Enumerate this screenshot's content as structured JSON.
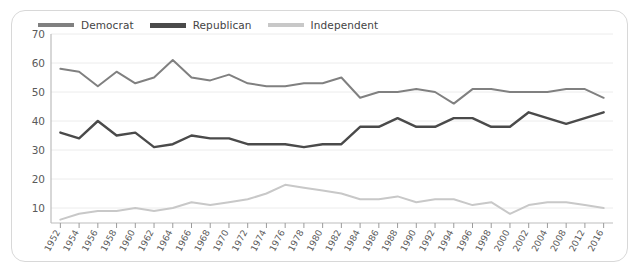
{
  "chart_data": {
    "type": "line",
    "title": "",
    "subtitle": "",
    "xlabel": "",
    "ylabel": "",
    "ylim": [
      0,
      70
    ],
    "yticks": [
      10,
      20,
      30,
      40,
      50,
      60,
      70
    ],
    "grid": true,
    "legend_position": "top-left",
    "legend": [
      "Democrat",
      "Republican",
      "Independent"
    ],
    "categories": [
      "1952",
      "1954",
      "1956",
      "1958",
      "1960",
      "1962",
      "1964",
      "1966",
      "1968",
      "1970",
      "1972",
      "1974",
      "1976",
      "1978",
      "1980",
      "1982",
      "1984",
      "1986",
      "1988",
      "1990",
      "1992",
      "1994",
      "1996",
      "1998",
      "2000",
      "2002",
      "2004",
      "2008",
      "2012",
      "2016"
    ],
    "series": [
      {
        "name": "Democrat",
        "color": "#808080",
        "values": [
          58,
          57,
          52,
          57,
          53,
          55,
          61,
          55,
          54,
          56,
          53,
          52,
          52,
          53,
          53,
          55,
          48,
          50,
          50,
          51,
          50,
          46,
          51,
          51,
          50,
          50,
          50,
          51,
          51,
          48
        ]
      },
      {
        "name": "Republican",
        "color": "#4a4a4a",
        "values": [
          36,
          34,
          40,
          35,
          36,
          31,
          32,
          35,
          34,
          34,
          32,
          32,
          32,
          31,
          32,
          32,
          38,
          38,
          41,
          38,
          38,
          41,
          41,
          38,
          38,
          43,
          41,
          39,
          41,
          43
        ]
      },
      {
        "name": "Independent",
        "color": "#c8c8c8",
        "values": [
          6,
          8,
          9,
          9,
          10,
          9,
          10,
          12,
          11,
          12,
          13,
          15,
          18,
          17,
          16,
          15,
          13,
          13,
          14,
          12,
          13,
          13,
          11,
          12,
          8,
          11,
          12,
          12,
          11,
          10
        ]
      }
    ]
  },
  "axes": {
    "y_tick_labels": [
      "70",
      "60",
      "50",
      "40",
      "30",
      "20",
      "10"
    ],
    "x_tick_labels": [
      "1952",
      "1954",
      "1956",
      "1958",
      "1960",
      "1962",
      "1964",
      "1966",
      "1968",
      "1970",
      "1972",
      "1974",
      "1976",
      "1978",
      "1980",
      "1982",
      "1984",
      "1986",
      "1988",
      "1990",
      "1992",
      "1994",
      "1996",
      "1998",
      "2000",
      "2002",
      "2004",
      "2008",
      "2012",
      "2016"
    ]
  },
  "legend": {
    "items": [
      {
        "label": "Democrat",
        "color": "#808080",
        "thickness": 4
      },
      {
        "label": "Republican",
        "color": "#4a4a4a",
        "thickness": 5
      },
      {
        "label": "Independent",
        "color": "#c8c8c8",
        "thickness": 4
      }
    ]
  },
  "colors": {
    "democrat": "#808080",
    "republican": "#4a4a4a",
    "independent": "#c8c8c8",
    "grid": "#ececec",
    "axis": "#bdbdbd",
    "card_border": "#d8d8d8",
    "text": "#5a5a5a",
    "background": "#ffffff"
  }
}
